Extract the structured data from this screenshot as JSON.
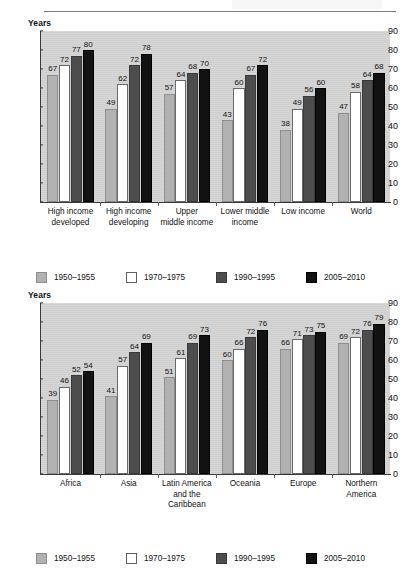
{
  "page": {
    "unit_label_top": "Years",
    "unit_label_bottom": "Years"
  },
  "series_colors": {
    "1950-1955": "#b2b2b2",
    "1970-1975": "#ffffff",
    "1990-1995": "#4d4d4d",
    "2005-2010": "#121212"
  },
  "legend": {
    "items": [
      {
        "label": "1950–1955",
        "swatch": "s0"
      },
      {
        "label": "1970–1975",
        "swatch": "s1"
      },
      {
        "label": "1990–1995",
        "swatch": "s2"
      },
      {
        "label": "2005–2010",
        "swatch": "s3"
      }
    ]
  },
  "chart_data": [
    {
      "type": "bar",
      "title": "",
      "xlabel": "",
      "ylabel": "Years",
      "ylim": [
        0,
        90
      ],
      "yticks": [
        0,
        10,
        20,
        30,
        40,
        50,
        60,
        70,
        80,
        90
      ],
      "grid": false,
      "legend_position": "bottom",
      "categories": [
        "High income\ndeveloped",
        "High income\ndeveloping",
        "Upper\nmiddle income",
        "Lower middle\nincome",
        "Low income",
        "World"
      ],
      "series": [
        {
          "name": "1950–1955",
          "values": [
            67,
            49,
            57,
            43,
            38,
            47
          ]
        },
        {
          "name": "1970–1975",
          "values": [
            72,
            62,
            64,
            60,
            49,
            58
          ]
        },
        {
          "name": "1990–1995",
          "values": [
            77,
            72,
            68,
            67,
            56,
            64
          ]
        },
        {
          "name": "2005–2010",
          "values": [
            80,
            78,
            70,
            72,
            60,
            68
          ]
        }
      ]
    },
    {
      "type": "bar",
      "title": "",
      "xlabel": "",
      "ylabel": "Years",
      "ylim": [
        0,
        90
      ],
      "yticks": [
        0,
        10,
        20,
        30,
        40,
        50,
        60,
        70,
        80,
        90
      ],
      "grid": false,
      "legend_position": "bottom",
      "categories": [
        "Africa",
        "Asia",
        "Latin America\nand the\nCaribbean",
        "Oceania",
        "Europe",
        "Northern\nAmerica"
      ],
      "series": [
        {
          "name": "1950–1955",
          "values": [
            39,
            41,
            51,
            60,
            66,
            69
          ]
        },
        {
          "name": "1970–1975",
          "values": [
            46,
            57,
            61,
            66,
            71,
            72
          ]
        },
        {
          "name": "1990–1995",
          "values": [
            52,
            64,
            69,
            72,
            73,
            76
          ]
        },
        {
          "name": "2005–2010",
          "values": [
            54,
            69,
            73,
            76,
            75,
            79
          ]
        }
      ]
    }
  ]
}
